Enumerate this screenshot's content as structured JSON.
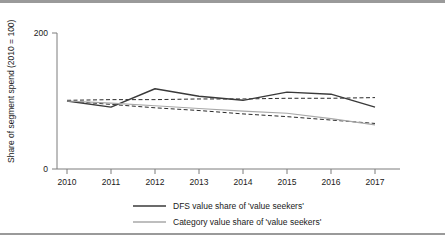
{
  "figure": {
    "background_color": "#ffffff",
    "border_color": "#9a9a9a"
  },
  "chart_data": {
    "type": "line",
    "title": "",
    "subtitle": "",
    "xlabel": "",
    "ylabel": "Share of segment spend (2010 = 100)",
    "categories": [
      "2010",
      "2011",
      "2012",
      "2013",
      "2014",
      "2015",
      "2016",
      "2017"
    ],
    "x": [
      2010,
      2011,
      2012,
      2013,
      2014,
      2015,
      2016,
      2017
    ],
    "ylim": [
      0,
      200
    ],
    "ytick_labels": [
      "0",
      "200"
    ],
    "ytick_values": [
      0,
      200
    ],
    "xtick_labels": [
      "2010",
      "2011",
      "2012",
      "2013",
      "2014",
      "2015",
      "2016",
      "2017"
    ],
    "grid": false,
    "legend_position": "bottom",
    "series": [
      {
        "name": "DFS value share of 'value seekers'",
        "values": [
          100,
          91,
          118,
          107,
          101,
          113,
          110,
          91
        ],
        "color": "#3a3a3a",
        "style": "solid",
        "width": 1.4
      },
      {
        "name": "Category value share of 'value seekers'",
        "values": [
          100,
          97,
          93,
          89,
          85,
          82,
          74,
          65
        ],
        "color": "#a8a8a8",
        "style": "solid",
        "width": 1.2
      }
    ],
    "trendlines": [
      {
        "name": "DFS trendline",
        "of_series": "DFS value share of 'value seekers'",
        "values": [
          101,
          102,
          102,
          103,
          103,
          104,
          104,
          105
        ],
        "color": "#2b2b2b",
        "style": "dashed"
      },
      {
        "name": "Category trendline",
        "of_series": "Category value share of 'value seekers'",
        "values": [
          100,
          95,
          90,
          86,
          81,
          77,
          72,
          67
        ],
        "color": "#2b2b2b",
        "style": "dashed"
      }
    ]
  },
  "legend": {
    "items": [
      {
        "label": "DFS value share of 'value seekers'",
        "color": "#3a3a3a",
        "swatch": "line-swatch-dark"
      },
      {
        "label": "Category value share of 'value seekers'",
        "color": "#a8a8a8",
        "swatch": "line-swatch-light"
      }
    ]
  }
}
